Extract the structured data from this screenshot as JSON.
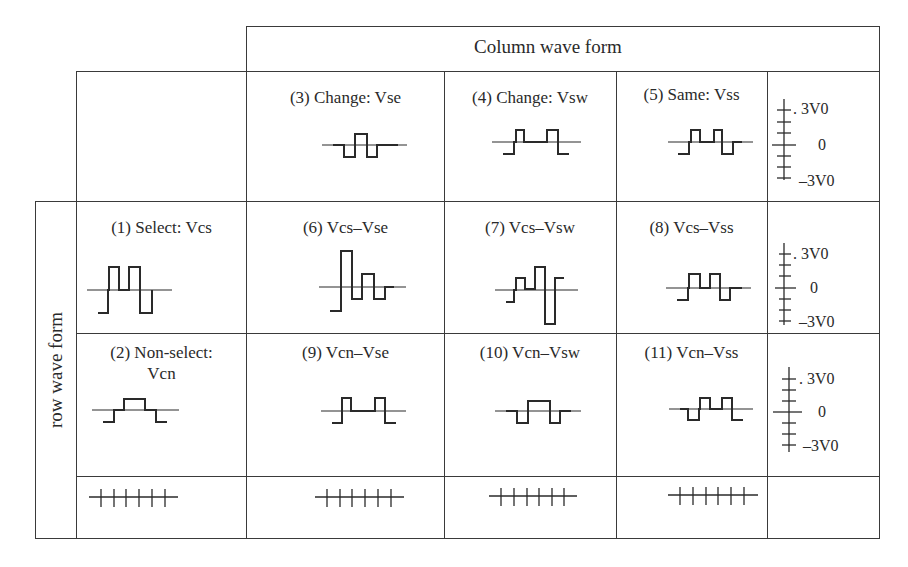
{
  "header": {
    "column_title": "Column wave form"
  },
  "row_axis_label": "row wave form",
  "column_waveforms": [
    {
      "id": 3,
      "label": "(3) Change: Vse"
    },
    {
      "id": 4,
      "label": "(4) Change: Vsw"
    },
    {
      "id": 5,
      "label": "(5) Same: Vss"
    }
  ],
  "rows": [
    {
      "row_waveform": {
        "id": 1,
        "label": "(1) Select: Vcs"
      },
      "cells": [
        {
          "id": 6,
          "label": "(6) Vcs–Vse"
        },
        {
          "id": 7,
          "label": "(7) Vcs–Vsw"
        },
        {
          "id": 8,
          "label": "(8) Vcs–Vss"
        }
      ]
    },
    {
      "row_waveform": {
        "id": 2,
        "label_line1": "(2) Non-select:",
        "label_line2": "Vcn"
      },
      "cells": [
        {
          "id": 9,
          "label": "(9) Vcn–Vse"
        },
        {
          "id": 10,
          "label": "(10) Vcn–Vsw"
        },
        {
          "id": 11,
          "label": "(11) Vcn–Vss"
        }
      ]
    }
  ],
  "voltage_scale": {
    "top": ". 3V0",
    "mid": "0",
    "bottom": "–3V0"
  },
  "time_axis": {
    "ticks": 6
  }
}
